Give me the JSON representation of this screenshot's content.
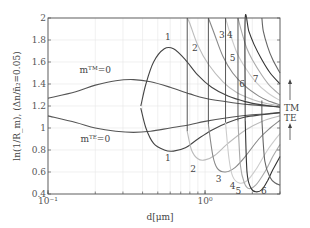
{
  "chart_data": {
    "type": "line",
    "title": "",
    "xlabel": "d[μm]",
    "ylabel": "ln(1/R_m), (Δn/n̄₂=0.05)",
    "xscale": "log",
    "xlim": [
      0.1,
      3.0
    ],
    "ylim": [
      0.4,
      2.0
    ],
    "grid": true,
    "x_ticks": [
      {
        "v": 0.1,
        "label": "10⁻¹"
      },
      {
        "v": 1.0,
        "label": "10⁰"
      }
    ],
    "y_ticks": [
      {
        "v": 0.4,
        "label": "0.4"
      },
      {
        "v": 0.6,
        "label": "0.6"
      },
      {
        "v": 0.8,
        "label": "0.8"
      },
      {
        "v": 1.0,
        "label": "1"
      },
      {
        "v": 1.2,
        "label": "1.2"
      },
      {
        "v": 1.4,
        "label": "1.4"
      },
      {
        "v": 1.6,
        "label": "1.6"
      },
      {
        "v": 1.8,
        "label": "1.8"
      },
      {
        "v": 2.0,
        "label": "2"
      }
    ],
    "series": [
      {
        "name": "m_TM=0",
        "color": "#555555",
        "x": [
          0.1,
          0.15,
          0.2,
          0.27,
          0.35,
          0.45,
          0.6,
          0.8,
          1.0,
          1.5,
          2.0,
          2.5,
          3.0
        ],
        "y": [
          1.27,
          1.33,
          1.39,
          1.43,
          1.44,
          1.42,
          1.37,
          1.31,
          1.27,
          1.23,
          1.21,
          1.2,
          1.19
        ]
      },
      {
        "name": "m_TE=0",
        "color": "#555555",
        "x": [
          0.1,
          0.15,
          0.2,
          0.27,
          0.35,
          0.45,
          0.6,
          0.8,
          1.0,
          1.5,
          2.0,
          2.5,
          3.0
        ],
        "y": [
          1.11,
          1.05,
          1.0,
          0.97,
          0.96,
          0.97,
          1.0,
          1.03,
          1.06,
          1.1,
          1.12,
          1.13,
          1.14
        ]
      },
      {
        "name": "TM 1",
        "color": "#444444",
        "x": [
          0.39,
          0.42,
          0.47,
          0.55,
          0.63,
          0.75,
          0.9,
          1.1,
          1.4,
          1.8,
          2.3,
          3.0
        ],
        "y": [
          1.2,
          1.4,
          1.6,
          1.72,
          1.72,
          1.62,
          1.48,
          1.37,
          1.29,
          1.24,
          1.21,
          1.19
        ]
      },
      {
        "name": "TE 1",
        "color": "#444444",
        "x": [
          0.39,
          0.42,
          0.47,
          0.55,
          0.63,
          0.75,
          0.9,
          1.1,
          1.4,
          1.8,
          2.3,
          3.0
        ],
        "y": [
          1.18,
          1.0,
          0.86,
          0.8,
          0.79,
          0.82,
          0.9,
          0.98,
          1.05,
          1.1,
          1.12,
          1.14
        ]
      },
      {
        "name": "TM 2",
        "color": "#bbbbbb",
        "x": [
          0.77,
          0.8,
          0.9,
          1.05,
          1.3,
          1.6,
          2.0,
          2.5,
          3.0
        ],
        "y": [
          2.0,
          1.95,
          1.75,
          1.58,
          1.42,
          1.32,
          1.26,
          1.22,
          1.2
        ]
      },
      {
        "name": "TE 2",
        "color": "#bbbbbb",
        "x": [
          0.77,
          0.82,
          0.9,
          1.0,
          1.15,
          1.4,
          1.8,
          2.3,
          3.0
        ],
        "y": [
          0.97,
          0.8,
          0.72,
          0.71,
          0.75,
          0.86,
          0.98,
          1.06,
          1.11
        ]
      },
      {
        "name": "TM 3",
        "color": "#888888",
        "x": [
          1.05,
          1.15,
          1.3,
          1.5,
          1.8,
          2.2,
          2.6,
          3.0
        ],
        "y": [
          2.0,
          1.85,
          1.65,
          1.5,
          1.38,
          1.29,
          1.24,
          1.21
        ]
      },
      {
        "name": "TE 3",
        "color": "#888888",
        "x": [
          1.05,
          1.12,
          1.2,
          1.35,
          1.55,
          1.8,
          2.2,
          2.6,
          3.0
        ],
        "y": [
          1.03,
          0.75,
          0.63,
          0.6,
          0.64,
          0.74,
          0.9,
          1.0,
          1.07
        ]
      },
      {
        "name": "TM 4",
        "color": "#cccccc",
        "x": [
          1.35,
          1.45,
          1.6,
          1.8,
          2.1,
          2.5,
          3.0
        ],
        "y": [
          2.0,
          1.85,
          1.68,
          1.55,
          1.42,
          1.32,
          1.25
        ]
      },
      {
        "name": "TE 4",
        "color": "#cccccc",
        "x": [
          1.35,
          1.42,
          1.5,
          1.65,
          1.85,
          2.1,
          2.5,
          3.0
        ],
        "y": [
          1.05,
          0.72,
          0.56,
          0.5,
          0.52,
          0.62,
          0.8,
          0.95
        ]
      },
      {
        "name": "TM 5",
        "color": "#aaaaaa",
        "x": [
          1.62,
          1.72,
          1.85,
          2.0,
          2.3,
          2.6,
          3.0
        ],
        "y": [
          2.0,
          1.86,
          1.72,
          1.62,
          1.48,
          1.38,
          1.3
        ]
      },
      {
        "name": "TE 5",
        "color": "#aaaaaa",
        "x": [
          1.62,
          1.68,
          1.78,
          1.9,
          2.1,
          2.4,
          2.7,
          3.0
        ],
        "y": [
          1.06,
          0.66,
          0.5,
          0.45,
          0.48,
          0.6,
          0.74,
          0.85
        ]
      },
      {
        "name": "TM 6",
        "color": "#333333",
        "x": [
          1.8,
          1.8,
          1.9,
          2.05,
          2.3,
          2.6,
          3.0
        ],
        "y": [
          1.25,
          2.0,
          1.88,
          1.76,
          1.62,
          1.5,
          1.4
        ]
      },
      {
        "name": "TE 6",
        "color": "#333333",
        "x": [
          1.8,
          1.85,
          1.95,
          2.1,
          2.3,
          2.5,
          2.7,
          3.0
        ],
        "y": [
          1.07,
          0.6,
          0.46,
          0.42,
          0.44,
          0.52,
          0.62,
          0.74
        ]
      },
      {
        "name": "TM 7",
        "color": "#666666",
        "x": [
          2.3,
          2.35,
          2.5,
          2.7,
          3.0
        ],
        "y": [
          2.0,
          1.88,
          1.74,
          1.62,
          1.5
        ]
      },
      {
        "name": "TE 7",
        "color": "#666666",
        "x": [
          2.3,
          2.4,
          2.6,
          2.8,
          3.0
        ],
        "y": [
          1.07,
          0.7,
          0.55,
          0.5,
          0.48
        ]
      }
    ],
    "vertical_lines": [
      {
        "x": 0.77,
        "y": [
          0.97,
          2.0
        ],
        "color": "#444444"
      },
      {
        "x": 1.05,
        "y": [
          1.03,
          2.0
        ],
        "color": "#444444"
      },
      {
        "x": 1.35,
        "y": [
          1.05,
          2.0
        ],
        "color": "#444444"
      },
      {
        "x": 1.62,
        "y": [
          1.06,
          2.0
        ],
        "color": "#444444"
      },
      {
        "x": 1.8,
        "y": [
          1.07,
          1.25
        ],
        "color": "#222222"
      },
      {
        "x": 2.3,
        "y": [
          1.07,
          1.25
        ],
        "color": "#444444"
      }
    ],
    "annotations": [
      {
        "text": "mᵀᴹ=0",
        "x": 0.2,
        "y": 1.5
      },
      {
        "text": "mᵀᴱ=0",
        "x": 0.2,
        "y": 0.87
      },
      {
        "text": "1",
        "x": 0.58,
        "y": 1.8
      },
      {
        "text": "2",
        "x": 0.86,
        "y": 1.7
      },
      {
        "text": "3",
        "x": 1.28,
        "y": 1.82
      },
      {
        "text": "4",
        "x": 1.44,
        "y": 1.82
      },
      {
        "text": "5",
        "x": 1.5,
        "y": 1.61
      },
      {
        "text": "6",
        "x": 1.72,
        "y": 1.37
      },
      {
        "text": "7",
        "x": 2.1,
        "y": 1.42
      },
      {
        "text": "1",
        "x": 0.58,
        "y": 0.7
      },
      {
        "text": "2",
        "x": 0.84,
        "y": 0.6
      },
      {
        "text": "3",
        "x": 1.22,
        "y": 0.51
      },
      {
        "text": "4",
        "x": 1.5,
        "y": 0.45
      },
      {
        "text": "5",
        "x": 1.63,
        "y": 0.4
      },
      {
        "text": "6",
        "x": 2.37,
        "y": 0.4
      }
    ],
    "side_labels": {
      "tm": "TM",
      "te": "TE"
    }
  }
}
